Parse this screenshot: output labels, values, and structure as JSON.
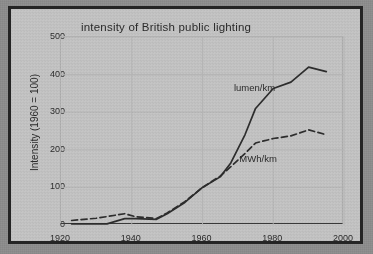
{
  "chart_data": {
    "type": "line",
    "title": "intensity of British public lighting",
    "xlabel": "",
    "ylabel": "Intensity (1960 = 100)",
    "xlim": [
      1920,
      2000
    ],
    "ylim": [
      0,
      500
    ],
    "xticks": [
      1920,
      1940,
      1960,
      1980,
      2000
    ],
    "yticks": [
      0,
      100,
      200,
      300,
      400,
      500
    ],
    "grid": true,
    "legend_position": "inline-annotation",
    "series": [
      {
        "name": "lumen/km",
        "style": "solid",
        "color": "#2d2d2d",
        "label_x": 1975,
        "label_y": 365,
        "x": [
          1923,
          1933,
          1938,
          1941,
          1947,
          1950,
          1955,
          1960,
          1965,
          1968,
          1972,
          1975,
          1980,
          1985,
          1990,
          1995
        ],
        "y": [
          3,
          3,
          17,
          17,
          15,
          30,
          60,
          100,
          128,
          165,
          240,
          310,
          363,
          380,
          420,
          408
        ]
      },
      {
        "name": "MWh/km",
        "style": "dashed",
        "color": "#2d2d2d",
        "label_x": 1976,
        "label_y": 175,
        "x": [
          1923,
          1930,
          1938,
          1941,
          1944,
          1947,
          1950,
          1955,
          1960,
          1965,
          1968,
          1972,
          1975,
          1980,
          1985,
          1990,
          1995
        ],
        "y": [
          12,
          18,
          30,
          22,
          20,
          17,
          32,
          62,
          100,
          130,
          155,
          190,
          218,
          230,
          237,
          253,
          240
        ]
      }
    ]
  }
}
